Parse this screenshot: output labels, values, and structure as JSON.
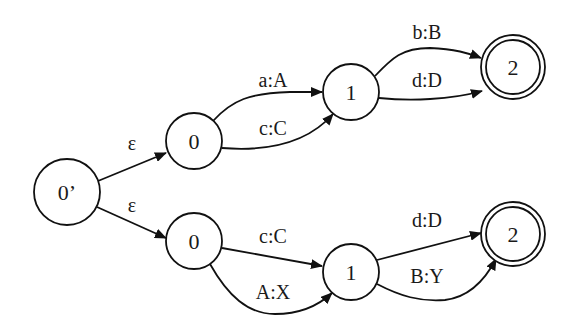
{
  "diagram": {
    "type": "finite-state-transducer",
    "nodes": [
      {
        "id": "start",
        "label": "0’",
        "x": 67,
        "y": 192,
        "r": 33,
        "accepting": false
      },
      {
        "id": "u0",
        "label": "0",
        "x": 194,
        "y": 141,
        "r": 28,
        "accepting": false
      },
      {
        "id": "u1",
        "label": "1",
        "x": 351,
        "y": 92,
        "r": 28,
        "accepting": false
      },
      {
        "id": "u2",
        "label": "2",
        "x": 513,
        "y": 67,
        "r": 32,
        "accepting": true
      },
      {
        "id": "l0",
        "label": "0",
        "x": 194,
        "y": 241,
        "r": 28,
        "accepting": false
      },
      {
        "id": "l1",
        "label": "1",
        "x": 351,
        "y": 272,
        "r": 28,
        "accepting": false
      },
      {
        "id": "l2",
        "label": "2",
        "x": 513,
        "y": 234,
        "r": 32,
        "accepting": true
      }
    ],
    "edges": [
      {
        "from": "start",
        "to": "u0",
        "label": "ε",
        "lx": 132,
        "ly": 143
      },
      {
        "from": "start",
        "to": "l0",
        "label": "ε",
        "lx": 132,
        "ly": 205
      },
      {
        "from": "u0",
        "to": "u1",
        "label": "a:A",
        "lx": 273,
        "ly": 80
      },
      {
        "from": "u0",
        "to": "u1",
        "label": "c:C",
        "lx": 273,
        "ly": 128
      },
      {
        "from": "u1",
        "to": "u2",
        "label": "b:B",
        "lx": 427,
        "ly": 32
      },
      {
        "from": "u1",
        "to": "u2",
        "label": "d:D",
        "lx": 427,
        "ly": 80
      },
      {
        "from": "l0",
        "to": "l1",
        "label": "c:C",
        "lx": 273,
        "ly": 236
      },
      {
        "from": "l0",
        "to": "l1",
        "label": "A:X",
        "lx": 273,
        "ly": 292
      },
      {
        "from": "l1",
        "to": "l2",
        "label": "d:D",
        "lx": 427,
        "ly": 220
      },
      {
        "from": "l1",
        "to": "l2",
        "label": "B:Y",
        "lx": 427,
        "ly": 276
      }
    ]
  },
  "labels": {
    "start": "0’",
    "upper_0": "0",
    "upper_1": "1",
    "upper_2": "2",
    "lower_0": "0",
    "lower_1": "1",
    "lower_2": "2",
    "eps_upper": "ε",
    "eps_lower": "ε",
    "upper_a_A": "a:A",
    "upper_c_C": "c:C",
    "upper_b_B": "b:B",
    "upper_d_D": "d:D",
    "lower_c_C": "c:C",
    "lower_A_X": "A:X",
    "lower_d_D": "d:D",
    "lower_B_Y": "B:Y"
  },
  "colors": {
    "stroke": "#111111",
    "background": "#ffffff",
    "text": "#1a1a1a"
  }
}
